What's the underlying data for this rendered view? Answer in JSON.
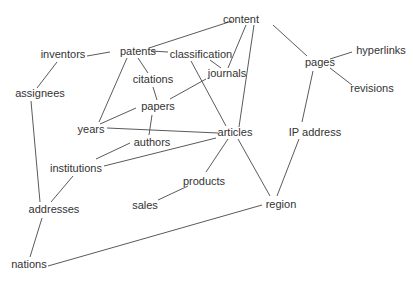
{
  "diagram": {
    "type": "concept-graph",
    "nodes": [
      {
        "id": "content",
        "label": "content",
        "x": 241,
        "y": 20
      },
      {
        "id": "inventors",
        "label": "inventors",
        "x": 63,
        "y": 55
      },
      {
        "id": "patents",
        "label": "patents",
        "x": 138,
        "y": 52
      },
      {
        "id": "classification",
        "label": "classification",
        "x": 201,
        "y": 55
      },
      {
        "id": "journals",
        "label": "journals",
        "x": 227,
        "y": 74
      },
      {
        "id": "pages",
        "label": "pages",
        "x": 320,
        "y": 63
      },
      {
        "id": "hyperlinks",
        "label": "hyperlinks",
        "x": 381,
        "y": 51
      },
      {
        "id": "revisions",
        "label": "revisions",
        "x": 372,
        "y": 89
      },
      {
        "id": "assignees",
        "label": "assignees",
        "x": 40,
        "y": 94
      },
      {
        "id": "citations",
        "label": "citations",
        "x": 153,
        "y": 80
      },
      {
        "id": "papers",
        "label": "papers",
        "x": 158,
        "y": 107
      },
      {
        "id": "years",
        "label": "years",
        "x": 91,
        "y": 130
      },
      {
        "id": "articles",
        "label": "articles",
        "x": 235,
        "y": 133
      },
      {
        "id": "ip_address",
        "label": "IP address",
        "x": 315,
        "y": 133
      },
      {
        "id": "authors",
        "label": "authors",
        "x": 152,
        "y": 143
      },
      {
        "id": "institutions",
        "label": "institutions",
        "x": 76,
        "y": 169
      },
      {
        "id": "products",
        "label": "products",
        "x": 204,
        "y": 182
      },
      {
        "id": "sales",
        "label": "sales",
        "x": 145,
        "y": 206
      },
      {
        "id": "addresses",
        "label": "addresses",
        "x": 54,
        "y": 210
      },
      {
        "id": "region",
        "label": "region",
        "x": 281,
        "y": 205
      },
      {
        "id": "nations",
        "label": "nations",
        "x": 29,
        "y": 265
      }
    ],
    "edges": [
      {
        "from": "content",
        "to": "patents",
        "x1": 232,
        "y1": 21,
        "x2": 149,
        "y2": 48
      },
      {
        "from": "content",
        "to": "journals",
        "x1": 246,
        "y1": 25,
        "x2": 228,
        "y2": 68
      },
      {
        "from": "content",
        "to": "articles",
        "x1": 254,
        "y1": 25,
        "x2": 239,
        "y2": 127
      },
      {
        "from": "content",
        "to": "pages",
        "x1": 273,
        "y1": 25,
        "x2": 307,
        "y2": 56
      },
      {
        "from": "pages",
        "to": "hyperlinks",
        "x1": 330,
        "y1": 59,
        "x2": 352,
        "y2": 52
      },
      {
        "from": "pages",
        "to": "revisions",
        "x1": 330,
        "y1": 68,
        "x2": 352,
        "y2": 85
      },
      {
        "from": "pages",
        "to": "ip_address",
        "x1": 313,
        "y1": 71,
        "x2": 302,
        "y2": 122
      },
      {
        "from": "ip_address",
        "to": "region",
        "x1": 299,
        "y1": 139,
        "x2": 277,
        "y2": 196
      },
      {
        "from": "inventors",
        "to": "patents",
        "x1": 87,
        "y1": 56,
        "x2": 110,
        "y2": 52
      },
      {
        "from": "inventors",
        "to": "assignees",
        "x1": 57,
        "y1": 62,
        "x2": 37,
        "y2": 88
      },
      {
        "from": "patents",
        "to": "classification",
        "x1": 151,
        "y1": 51,
        "x2": 168,
        "y2": 52
      },
      {
        "from": "patents",
        "to": "citations",
        "x1": 138,
        "y1": 58,
        "x2": 148,
        "y2": 73
      },
      {
        "from": "patents",
        "to": "years",
        "x1": 127,
        "y1": 58,
        "x2": 99,
        "y2": 122
      },
      {
        "from": "classification",
        "to": "journals",
        "x1": 210,
        "y1": 60,
        "x2": 221,
        "y2": 68
      },
      {
        "from": "classification",
        "to": "articles",
        "x1": 191,
        "y1": 61,
        "x2": 226,
        "y2": 126
      },
      {
        "from": "citations",
        "to": "papers",
        "x1": 153,
        "y1": 87,
        "x2": 157,
        "y2": 100
      },
      {
        "from": "journals",
        "to": "papers",
        "x1": 206,
        "y1": 79,
        "x2": 170,
        "y2": 99
      },
      {
        "from": "papers",
        "to": "years",
        "x1": 136,
        "y1": 108,
        "x2": 100,
        "y2": 124
      },
      {
        "from": "papers",
        "to": "authors",
        "x1": 152,
        "y1": 115,
        "x2": 149,
        "y2": 135
      },
      {
        "from": "years",
        "to": "articles",
        "x1": 107,
        "y1": 128,
        "x2": 218,
        "y2": 133
      },
      {
        "from": "authors",
        "to": "institutions",
        "x1": 130,
        "y1": 143,
        "x2": 96,
        "y2": 159
      },
      {
        "from": "institutions",
        "to": "articles",
        "x1": 104,
        "y1": 166,
        "x2": 216,
        "y2": 138
      },
      {
        "from": "institutions",
        "to": "addresses",
        "x1": 73,
        "y1": 176,
        "x2": 51,
        "y2": 202
      },
      {
        "from": "articles",
        "to": "products",
        "x1": 228,
        "y1": 139,
        "x2": 206,
        "y2": 172
      },
      {
        "from": "articles",
        "to": "region",
        "x1": 238,
        "y1": 139,
        "x2": 270,
        "y2": 196
      },
      {
        "from": "products",
        "to": "sales",
        "x1": 188,
        "y1": 186,
        "x2": 158,
        "y2": 200
      },
      {
        "from": "assignees",
        "to": "addresses",
        "x1": 31,
        "y1": 101,
        "x2": 40,
        "y2": 202
      },
      {
        "from": "addresses",
        "to": "nations",
        "x1": 42,
        "y1": 218,
        "x2": 30,
        "y2": 257
      },
      {
        "from": "nations",
        "to": "region",
        "x1": 48,
        "y1": 266,
        "x2": 262,
        "y2": 205
      }
    ],
    "colors": {
      "background": "#ffffff",
      "text": "#333333",
      "edge": "#5a5a5a"
    }
  }
}
